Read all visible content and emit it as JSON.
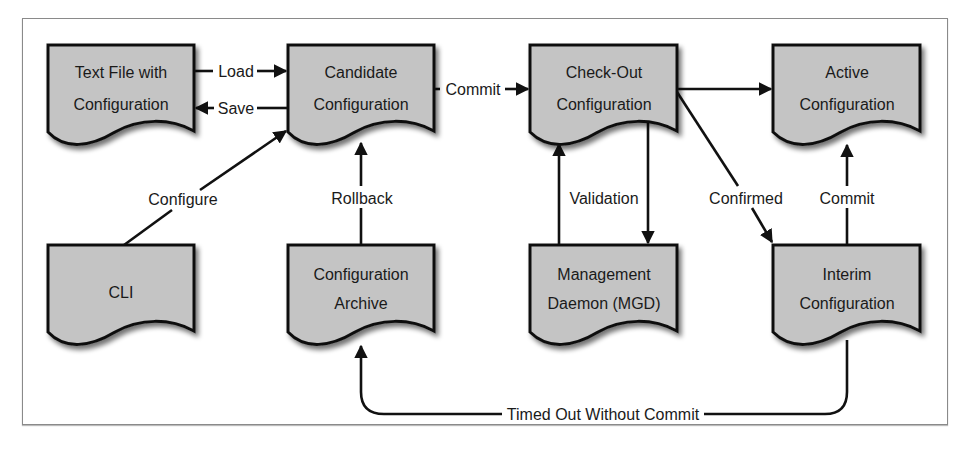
{
  "diagram": {
    "type": "flowchart",
    "nodes": {
      "text_file": {
        "line1": "Text File with",
        "line2": "Configuration"
      },
      "candidate": {
        "line1": "Candidate",
        "line2": "Configuration"
      },
      "checkout": {
        "line1": "Check-Out",
        "line2": "Configuration"
      },
      "active": {
        "line1": "Active",
        "line2": "Configuration"
      },
      "cli": {
        "line1": "CLI"
      },
      "archive": {
        "line1": "Configuration",
        "line2": "Archive"
      },
      "mgd": {
        "line1": "Management",
        "line2": "Daemon (MGD)"
      },
      "interim": {
        "line1": "Interim",
        "line2": "Configuration"
      }
    },
    "edges": {
      "load": {
        "label": "Load",
        "from": "Text File with Configuration",
        "to": "Candidate Configuration"
      },
      "save": {
        "label": "Save",
        "from": "Candidate Configuration",
        "to": "Text File with Configuration"
      },
      "commit_1": {
        "label": "Commit",
        "from": "Candidate Configuration",
        "to": "Check-Out Configuration"
      },
      "to_active": {
        "label": "",
        "from": "Check-Out Configuration",
        "to": "Active Configuration"
      },
      "configure": {
        "label": "Configure",
        "from": "CLI",
        "to": "Candidate Configuration"
      },
      "rollback": {
        "label": "Rollback",
        "from": "Configuration Archive",
        "to": "Candidate Configuration"
      },
      "validation": {
        "label": "Validation",
        "from": "Check-Out Configuration",
        "to": "Management Daemon (MGD)"
      },
      "confirmed": {
        "label": "Confirmed",
        "from": "Check-Out Configuration",
        "to": "Interim Configuration"
      },
      "commit_2": {
        "label": "Commit",
        "from": "Interim Configuration",
        "to": "Active Configuration"
      },
      "timed_out": {
        "label": "Timed Out Without Commit",
        "from": "Interim Configuration",
        "to": "Configuration Archive"
      }
    },
    "colors": {
      "node_fill": "#c4c4c4",
      "stroke": "#111111",
      "frame": "#8a8a8a"
    }
  }
}
